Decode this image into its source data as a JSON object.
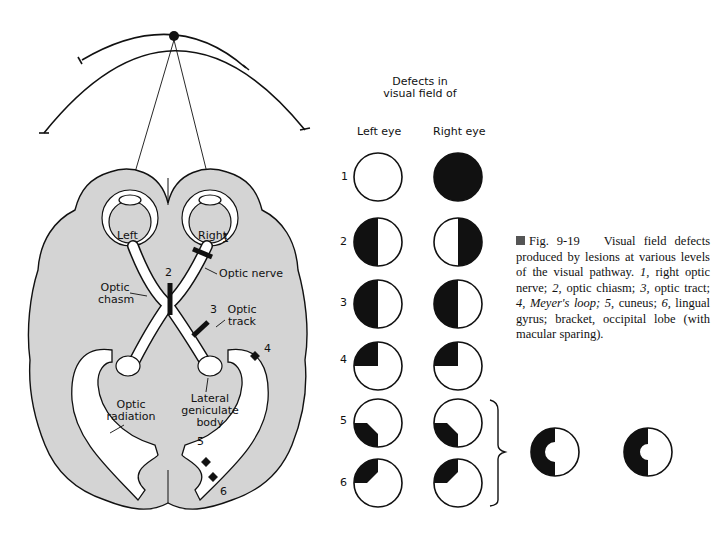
{
  "diagram": {
    "brain_labels": {
      "left_eye": "Left",
      "right_eye": "Right",
      "optic_nerve": "Optic nerve",
      "optic_chiasm": "Optic\nchasm",
      "optic_chiasm_line1": "Optic",
      "optic_chiasm_line2": "chasm",
      "optic_tract_line1": "Optic",
      "optic_tract_line2": "track",
      "lgb_line1": "Lateral",
      "lgb_line2": "geniculate",
      "lgb_line3": "body",
      "radiation_line1": "Optic",
      "radiation_line2": "radiation",
      "lesion_numbers": [
        "1",
        "2",
        "3",
        "4",
        "5",
        "6"
      ]
    },
    "defects_header_line1": "Defects in",
    "defects_header_line2": "visual field of",
    "column_left": "Left eye",
    "column_right": "Right eye",
    "rows": [
      {
        "num": "1",
        "left": "normal",
        "right": "total blindness"
      },
      {
        "num": "2",
        "left": "left half (temporal) black",
        "right": "right half (temporal) black"
      },
      {
        "num": "3",
        "left": "left half black",
        "right": "left half black"
      },
      {
        "num": "4",
        "left": "upper-left quadrant black",
        "right": "upper-left quadrant black"
      },
      {
        "num": "5",
        "left": "lower-left quadrant black (macular notch)",
        "right": "lower-left quadrant black (macular notch)"
      },
      {
        "num": "6",
        "left": "upper-left quadrant black (macular notch)",
        "right": "upper-left quadrant black (macular notch)"
      }
    ],
    "bracket_result": "left homonymous hemianopia with macular sparing (both eyes)",
    "caption": {
      "fig": "Fig. 9-19",
      "text_a": "Visual field defects produced by lesions at various levels of the visual pathway.",
      "n1": "1,",
      "t1": "right optic nerve;",
      "n2": "2,",
      "t2": "optic chiasm;",
      "n3": "3,",
      "t3": "optic tract;",
      "n4": "4,",
      "t4": "Meyer's loop;",
      "n5": "5,",
      "t5": "cuneus;",
      "n6": "6,",
      "t6": "lingual gyrus; bracket, occipital lobe (with macular sparing)."
    }
  }
}
